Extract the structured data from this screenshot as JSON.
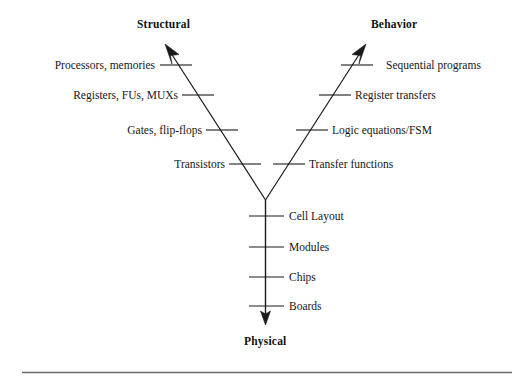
{
  "diagram": {
    "axes": {
      "structural": {
        "title": "Structural",
        "arrow_direction": "up-left"
      },
      "behavior": {
        "title": "Behavior",
        "arrow_direction": "up-right"
      },
      "physical": {
        "title": "Physical",
        "arrow_direction": "down"
      }
    },
    "structural_levels": [
      {
        "label": "Processors, memories"
      },
      {
        "label": "Registers, FUs, MUXs"
      },
      {
        "label": "Gates, flip-flops"
      },
      {
        "label": "Transistors"
      }
    ],
    "behavior_levels": [
      {
        "label": "Sequential programs"
      },
      {
        "label": "Register transfers"
      },
      {
        "label": "Logic equations/FSM"
      },
      {
        "label": "Transfer functions"
      }
    ],
    "physical_levels": [
      {
        "label": "Cell Layout"
      },
      {
        "label": "Modules"
      },
      {
        "label": "Chips"
      },
      {
        "label": "Boards"
      }
    ],
    "colors": {
      "line": "#1a1a1a",
      "text": "#161616",
      "background": "#ffffff",
      "rule": "#6b6b6b"
    }
  }
}
